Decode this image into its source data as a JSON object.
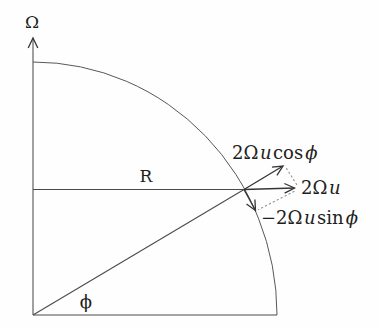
{
  "figure": {
    "description_colors": {
      "background": "#fefefe",
      "line": "#4a4a4a",
      "vector": "#353535",
      "dotted_projection": "#8f8f8f",
      "text": "#1e1e1e"
    },
    "labels": {
      "rotation_axis": "Ω",
      "radius": "R",
      "latitude_angle": "ϕ",
      "vector_full": {
        "coef": "2Ω",
        "var": "u"
      },
      "vector_radial": {
        "coef": "2Ω",
        "var": "u",
        "func": "cos",
        "angle": "ϕ"
      },
      "vector_tangential": {
        "coef": "−2Ω",
        "var": "u",
        "func": "sin",
        "angle": "ϕ"
      }
    }
  }
}
